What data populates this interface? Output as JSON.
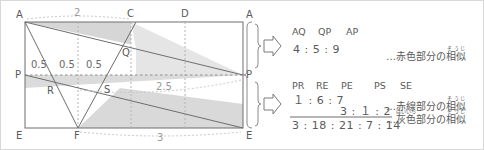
{
  "figure": {
    "vertex_labels": {
      "a_left": "A",
      "a_right": "A",
      "c": "C",
      "d": "D",
      "e_left": "E",
      "e_right": "E",
      "f": "F",
      "p_left": "P",
      "p_right": "P",
      "q": "Q",
      "r": "R",
      "s": "S"
    },
    "dimensions": {
      "top": "2",
      "middle": "2.5",
      "bottom": "3",
      "seg1": "0.5",
      "seg2": "0.5",
      "seg3": "0.5"
    },
    "colors": {
      "outline": "#6e6e6e",
      "shade": "#c9c9c9",
      "dotted": "#b4b4b4",
      "border": "#d8d8d8"
    }
  },
  "annotations": {
    "block1": {
      "headers": [
        "AQ",
        "QP",
        "AP"
      ],
      "values": [
        "4",
        ":",
        "5",
        ":",
        "9"
      ],
      "value_line": "4 : 5 : 9",
      "note_prefix": "…",
      "note_text": "赤色部分の相似",
      "note_head": "赤色部分の",
      "note_kanji": "相似",
      "note_furigana": "そうじ"
    },
    "block2": {
      "headers": [
        "PR",
        "RE",
        "PE",
        "PS",
        "SE"
      ],
      "row1": "１ : 6 : 7",
      "row2": "3 : １ : 2",
      "total": "3 : 18 : 21 : 7 : 14",
      "note1_prefix": "…",
      "note1_head": "赤線部分の",
      "note1_kanji": "相似",
      "note1_furigana": "そうじ",
      "note2_prefix": "…",
      "note2_kanji1": "灰色",
      "note2_furigana1": "はいいろ",
      "note2_mid": "部分の",
      "note2_kanji2": "相似",
      "note2_furigana2": "そうじ"
    },
    "arrow_icon": "right-arrow-pentagon"
  }
}
